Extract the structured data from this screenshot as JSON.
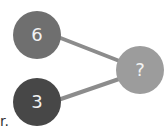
{
  "diagram": {
    "nodes": [
      {
        "id": "top",
        "label": "6",
        "color": "#6f6f6f"
      },
      {
        "id": "bottom",
        "label": "3",
        "color": "#474747"
      },
      {
        "id": "result",
        "label": "?",
        "color": "#9c9c9c"
      }
    ],
    "edges": [
      {
        "from": "top",
        "to": "result"
      },
      {
        "from": "bottom",
        "to": "result"
      }
    ],
    "edge_color": "#8c8c8c"
  },
  "text_fragment": "r."
}
